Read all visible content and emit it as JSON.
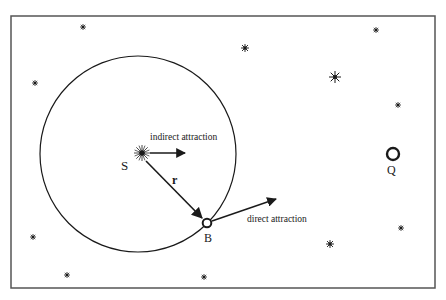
{
  "diagram": {
    "labels": {
      "sun": "S",
      "body": "B",
      "other_body": "Q",
      "radius_vector": "r",
      "indirect": "indirect attraction",
      "direct": "direct attraction"
    },
    "colors": {
      "ink": "#1a1a1a",
      "frame": "#555555",
      "background": "#ffffff"
    },
    "frame": {
      "x": 11,
      "y": 16,
      "width": 424,
      "height": 272
    },
    "orbit_circle": {
      "cx": 138,
      "cy": 154,
      "r": 98
    },
    "sun": {
      "x": 142,
      "y": 153
    },
    "body_B": {
      "x": 207,
      "y": 223
    },
    "body_Q": {
      "x": 393,
      "y": 154
    },
    "background_stars": [
      {
        "x": 83,
        "y": 27,
        "size": "small"
      },
      {
        "x": 245,
        "y": 48,
        "size": "medium"
      },
      {
        "x": 376,
        "y": 30,
        "size": "small"
      },
      {
        "x": 35,
        "y": 83,
        "size": "small"
      },
      {
        "x": 335,
        "y": 77,
        "size": "large"
      },
      {
        "x": 398,
        "y": 105,
        "size": "small"
      },
      {
        "x": 33,
        "y": 237,
        "size": "small"
      },
      {
        "x": 401,
        "y": 228,
        "size": "small"
      },
      {
        "x": 330,
        "y": 244,
        "size": "medium"
      },
      {
        "x": 67,
        "y": 275,
        "size": "small"
      },
      {
        "x": 204,
        "y": 277,
        "size": "small"
      }
    ]
  }
}
